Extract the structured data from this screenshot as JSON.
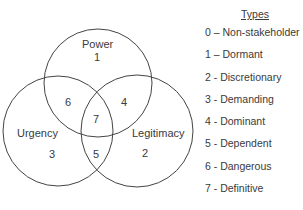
{
  "diagram": {
    "circles": [
      {
        "name": "Power",
        "number": "1"
      },
      {
        "name": "Urgency",
        "number": "3"
      },
      {
        "name": "Legitimacy",
        "number": "2"
      }
    ],
    "intersections": {
      "power_urgency": "6",
      "power_legitimacy": "4",
      "urgency_legitimacy": "5",
      "all": "7"
    }
  },
  "legend": {
    "title": "Types",
    "items": [
      "0 – Non-stakeholder",
      "1 – Dormant",
      "2 - Discretionary",
      "3 - Demanding",
      "4 - Dominant",
      "5 - Dependent",
      "6 - Dangerous",
      "7 - Definitive"
    ]
  }
}
